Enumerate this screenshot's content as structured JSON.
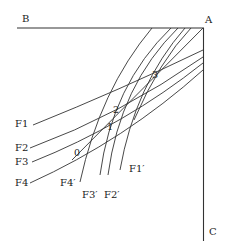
{
  "diagram": {
    "corners": {
      "B": "B",
      "A": "A",
      "C": "C"
    },
    "curves_family_f": [
      "F1",
      "F2",
      "F3",
      "F4"
    ],
    "curves_family_f_prime": [
      "F1′",
      "F2′",
      "F3′",
      "F4′"
    ],
    "intersection_points": [
      "0",
      "1",
      "2",
      "3"
    ],
    "colors": {
      "line": "#333333",
      "text": "#222222",
      "background": "#ffffff"
    }
  }
}
